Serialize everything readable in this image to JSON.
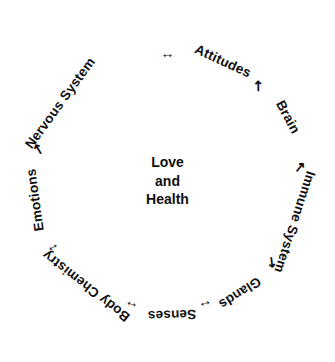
{
  "diagram": {
    "type": "cycle",
    "center": {
      "lines": [
        "Love",
        "and",
        "Health"
      ]
    },
    "nodes": [
      {
        "label": "Attitudes",
        "angle_deg": 25,
        "radius": 132
      },
      {
        "label": "Brain",
        "angle_deg": 62,
        "radius": 136
      },
      {
        "label": "Immune System",
        "angle_deg": 108,
        "radius": 134
      },
      {
        "label": "Glands",
        "angle_deg": 147,
        "radius": 133
      },
      {
        "label": "Senses",
        "angle_deg": 178,
        "radius": 134
      },
      {
        "label": "Body Chemistry",
        "angle_deg": 218,
        "radius": 133
      },
      {
        "label": "Emotions",
        "angle_deg": 262,
        "radius": 134
      },
      {
        "label": "Nervous System",
        "angle_deg": 306,
        "radius": 133
      }
    ],
    "connectors": [
      {
        "glyph": "↔",
        "angle_deg": 0,
        "radius": 128,
        "from": "Nervous System",
        "to": "Attitudes",
        "double": true
      },
      {
        "glyph": "↖",
        "angle_deg": 44,
        "radius": 132,
        "from": "Attitudes",
        "to": "Brain",
        "double": false
      },
      {
        "glyph": "↖",
        "angle_deg": 84,
        "radius": 134,
        "from": "Brain",
        "to": "Immune System",
        "double": false
      },
      {
        "glyph": "↗",
        "angle_deg": 128,
        "radius": 133,
        "from": "Glands",
        "to": "Immune System",
        "double": false
      },
      {
        "glyph": "↔",
        "angle_deg": 163,
        "radius": 131,
        "from": "Senses",
        "to": "Glands",
        "double": true
      },
      {
        "glyph": "↔",
        "angle_deg": 196,
        "radius": 131,
        "from": "Body Chemistry",
        "to": "Senses",
        "double": true
      },
      {
        "glyph": "↕",
        "angle_deg": 240,
        "radius": 133,
        "from": "Emotions",
        "to": "Body Chemistry",
        "double": true
      },
      {
        "glyph": "↗",
        "angle_deg": 284,
        "radius": 133,
        "from": "Emotions",
        "to": "Nervous System",
        "double": false
      }
    ],
    "colors": {
      "background": "#ffffff",
      "text": "#101010"
    }
  }
}
